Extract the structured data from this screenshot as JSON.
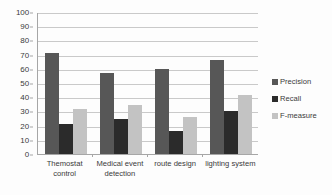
{
  "chart_data": {
    "type": "bar",
    "title": "",
    "xlabel": "",
    "ylabel": "",
    "ylim": [
      0,
      100
    ],
    "ytick_step": 10,
    "yticks": [
      "100",
      "90",
      "80",
      "70",
      "60",
      "50",
      "40",
      "30",
      "20",
      "10",
      "0"
    ],
    "grid": true,
    "legend_position": "right",
    "categories": [
      "Themostat control",
      "Medical event detection",
      "route design",
      "lighting system"
    ],
    "series": [
      {
        "name": "Precision",
        "color": "#575757",
        "values": [
          71,
          57,
          60,
          66
        ]
      },
      {
        "name": "Recall",
        "color": "#2b2b2b",
        "values": [
          21,
          25,
          16,
          30
        ]
      },
      {
        "name": "F-measure",
        "color": "#c3c3c3",
        "values": [
          32,
          34.5,
          26,
          41.5
        ]
      }
    ]
  },
  "legend": {
    "items": [
      {
        "label": "Precision"
      },
      {
        "label": "Recall"
      },
      {
        "label": "F-measure"
      }
    ]
  }
}
